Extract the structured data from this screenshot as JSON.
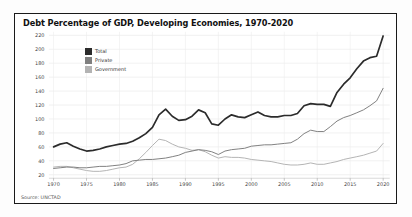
{
  "chart_data": {
    "type": "line",
    "title": "Debt Percentage of GDP, Developing Economies, 1970-2020",
    "source": "Source: UNCTAD",
    "xlabel": "",
    "ylabel": "",
    "x": [
      1970,
      1971,
      1972,
      1973,
      1974,
      1975,
      1976,
      1977,
      1978,
      1979,
      1980,
      1981,
      1982,
      1983,
      1984,
      1985,
      1986,
      1987,
      1988,
      1989,
      1990,
      1991,
      1992,
      1993,
      1994,
      1995,
      1996,
      1997,
      1998,
      1999,
      2000,
      2001,
      2002,
      2003,
      2004,
      2005,
      2006,
      2007,
      2008,
      2009,
      2010,
      2011,
      2012,
      2013,
      2014,
      2015,
      2016,
      2017,
      2018,
      2019,
      2020
    ],
    "series": [
      {
        "name": "Total",
        "color": "#2b2b2b",
        "width": 1.7,
        "values": [
          60,
          64,
          66,
          61,
          57,
          54,
          55,
          57,
          60,
          62,
          64,
          65,
          68,
          73,
          79,
          88,
          106,
          114,
          104,
          98,
          99,
          104,
          113,
          109,
          93,
          91,
          100,
          106,
          103,
          102,
          106,
          110,
          105,
          103,
          103,
          105,
          105,
          108,
          119,
          122,
          121,
          121,
          118,
          138,
          150,
          159,
          172,
          183,
          188,
          190,
          219
        ]
      },
      {
        "name": "Private",
        "color": "#7f7f7f",
        "width": 1,
        "values": [
          29,
          30,
          31,
          31,
          30,
          30,
          31,
          32,
          32,
          33,
          34,
          36,
          40,
          41,
          42,
          42,
          43,
          44,
          46,
          48,
          52,
          54,
          56,
          55,
          53,
          49,
          54,
          56,
          57,
          58,
          61,
          62,
          63,
          63,
          64,
          65,
          66,
          71,
          79,
          84,
          82,
          82,
          89,
          97,
          102,
          105,
          109,
          113,
          119,
          126,
          144
        ]
      },
      {
        "name": "Government",
        "color": "#b3b3b3",
        "width": 1,
        "values": [
          31,
          32,
          32,
          30,
          28,
          26,
          25,
          25,
          26,
          28,
          30,
          31,
          35,
          43,
          52,
          62,
          71,
          69,
          64,
          60,
          58,
          55,
          56,
          53,
          48,
          44,
          46,
          45,
          45,
          44,
          42,
          41,
          40,
          39,
          37,
          35,
          34,
          34,
          35,
          37,
          35,
          35,
          37,
          39,
          42,
          44,
          46,
          48,
          51,
          54,
          65
        ]
      }
    ],
    "xticks": [
      1970,
      1975,
      1980,
      1985,
      1990,
      1995,
      2000,
      2005,
      2010,
      2015,
      2020
    ],
    "yticks": [
      20,
      40,
      60,
      80,
      100,
      120,
      140,
      160,
      180,
      200,
      220
    ],
    "xlim": [
      1969,
      2021
    ],
    "ylim": [
      15,
      225
    ],
    "grid": true,
    "legend_position": "upper-left"
  }
}
